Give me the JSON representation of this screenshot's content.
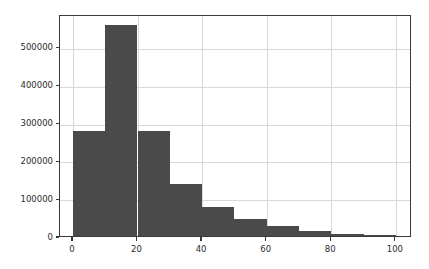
{
  "chart_data": {
    "type": "bar",
    "title": "",
    "subtitle": "",
    "xlabel": "",
    "ylabel": "",
    "legend": [],
    "grid": true,
    "legend_position": "none",
    "bin_width": 10,
    "bin_edges": [
      0,
      10,
      20,
      30,
      40,
      50,
      60,
      70,
      80,
      90,
      100
    ],
    "categories": [
      "0-10",
      "10-20",
      "20-30",
      "30-40",
      "40-50",
      "50-60",
      "60-70",
      "70-80",
      "80-90",
      "90-100"
    ],
    "values": [
      278000,
      558000,
      278000,
      138000,
      77000,
      45000,
      27000,
      13000,
      5000,
      3000
    ],
    "xlim": [
      -4,
      105
    ],
    "ylim": [
      0,
      587000
    ],
    "xticks": [
      0,
      20,
      40,
      60,
      80,
      100
    ],
    "xtick_labels": [
      "0",
      "20",
      "40",
      "60",
      "80",
      "100"
    ],
    "yticks": [
      0,
      100000,
      200000,
      300000,
      400000,
      500000
    ],
    "ytick_labels": [
      "0",
      "100000",
      "200000",
      "300000",
      "400000",
      "500000"
    ],
    "colors": {
      "bar": "#4a4a4a",
      "grid": "#d8d8d8",
      "axis": "#3a3a3a",
      "background": "#ffffff",
      "tick_text": "#2b2b2b"
    }
  }
}
